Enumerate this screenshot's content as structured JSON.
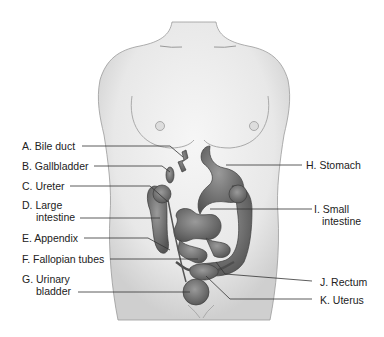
{
  "diagram": {
    "colors": {
      "background": "#ffffff",
      "skin": "#ececec",
      "skin_shadow": "#c9c9c9",
      "organ": "#7a7a7a",
      "organ_dark": "#4e4e4e",
      "leader_line": "#333333",
      "text": "#222222"
    },
    "labels_left": [
      {
        "id": "A",
        "line1": "A. Bile duct",
        "line2": ""
      },
      {
        "id": "B",
        "line1": "B. Gallbladder",
        "line2": ""
      },
      {
        "id": "C",
        "line1": "C. Ureter",
        "line2": ""
      },
      {
        "id": "D",
        "line1": "D.  Large",
        "line2": "intestine"
      },
      {
        "id": "E",
        "line1": "E. Appendix",
        "line2": ""
      },
      {
        "id": "F",
        "line1": "F. Fallopian tubes",
        "line2": ""
      },
      {
        "id": "G",
        "line1": "G.  Urinary",
        "line2": "bladder"
      }
    ],
    "labels_right": [
      {
        "id": "H",
        "line1": "H. Stomach",
        "line2": ""
      },
      {
        "id": "I",
        "line1": "I.  Small",
        "line2": "intestine"
      },
      {
        "id": "J",
        "line1": "J. Rectum",
        "line2": ""
      },
      {
        "id": "K",
        "line1": "K. Uterus",
        "line2": ""
      }
    ]
  }
}
